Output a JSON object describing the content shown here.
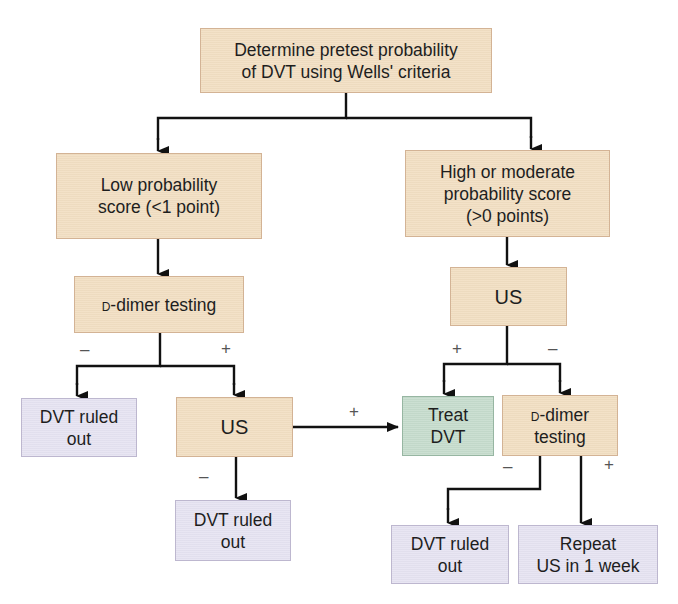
{
  "diagram": {
    "type": "flowchart",
    "topic": "DVT diagnostic algorithm",
    "colors": {
      "process_box": "#f2dfc3",
      "outcome_box": "#e6e3f2",
      "treat_box": "#c6dccd",
      "line": "#111111"
    },
    "nodes": {
      "start": {
        "line1": "Determine pretest probability",
        "line2": "of DVT using Wells' criteria"
      },
      "low": {
        "line1": "Low probability",
        "line2": "score (<1 point)"
      },
      "high": {
        "line1": "High or moderate",
        "line2": "probability score",
        "line3": "(>0 points)"
      },
      "ddimer_left": {
        "prefix": "d",
        "text": "-dimer testing"
      },
      "us_right": {
        "label": "US"
      },
      "ruled_out_left": {
        "line1": "DVT ruled",
        "line2": "out"
      },
      "us_mid": {
        "label": "US"
      },
      "treat": {
        "line1": "Treat",
        "line2": "DVT"
      },
      "ddimer_right": {
        "prefix": "d",
        "line1": "-dimer",
        "line2": "testing"
      },
      "ruled_out_mid": {
        "line1": "DVT ruled",
        "line2": "out"
      },
      "ruled_out_right": {
        "line1": "DVT ruled",
        "line2": "out"
      },
      "repeat": {
        "line1": "Repeat",
        "line2": "US in 1 week"
      }
    },
    "edge_labels": {
      "ddimer_left_neg": "–",
      "ddimer_left_pos": "+",
      "us_right_pos": "+",
      "us_right_neg": "–",
      "us_mid_pos": "+",
      "us_mid_neg": "–",
      "ddimer_right_neg": "–",
      "ddimer_right_pos": "+"
    }
  }
}
